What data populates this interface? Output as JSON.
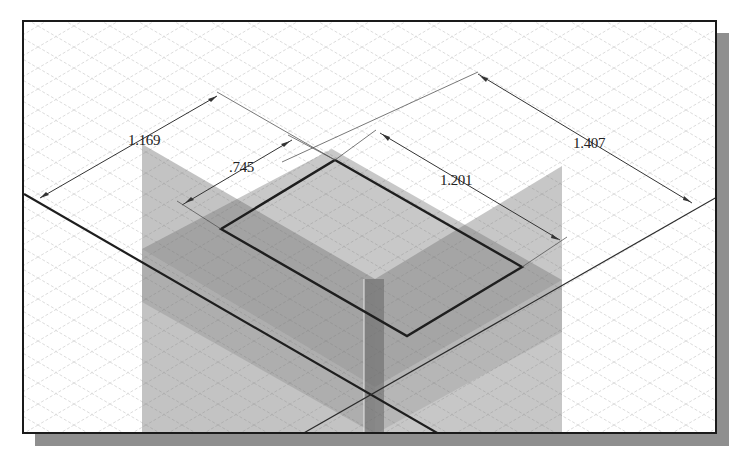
{
  "view": {
    "type": "isometric-sketch",
    "background": "#ffffff",
    "frame_color": "#1a1a1a",
    "shadow_color": "#8f8f8f",
    "grid_color": "#cfcfcf",
    "plane_color": "#8a8a8a",
    "sketch_line_color": "#1e1e1e"
  },
  "dimensions": [
    {
      "id": "dim-1169",
      "label": "1.169"
    },
    {
      "id": "dim-745",
      "label": ".745"
    },
    {
      "id": "dim-1201",
      "label": "1.201"
    },
    {
      "id": "dim-1407",
      "label": "1.407"
    }
  ]
}
